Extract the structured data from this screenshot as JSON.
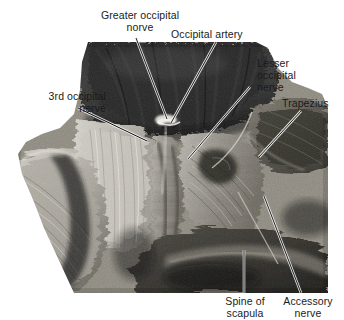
{
  "figure": {
    "kind": "anatomical-dissection-photograph",
    "region": "posterior neck and suboccipital region",
    "photo": {
      "left": 16,
      "top": 42,
      "width": 312,
      "height": 251,
      "tone": "black-and-white"
    }
  },
  "labels": [
    {
      "id": "greater-occipital-nerve",
      "name": "greater-occipital-nerve-label",
      "text": "Greater occipital\nnorve",
      "lines": [
        "Greater occipital",
        "norve"
      ],
      "leader": {
        "x1": 136,
        "y1": 38,
        "x2": 167,
        "y2": 119
      }
    },
    {
      "id": "occipital-artery",
      "name": "occipital-artery-label",
      "text": "Occipital artery",
      "lines": [
        "Occipital artery"
      ],
      "leader": {
        "x1": 216,
        "y1": 42,
        "x2": 171,
        "y2": 123
      }
    },
    {
      "id": "lesser-occipital-nerve",
      "name": "lesser-occipital-nerve-label",
      "text": "Lesser\noccipital\nnerve",
      "lines": [
        "Lesser",
        "occipital",
        "nerve"
      ],
      "leader": {
        "x1": 250,
        "y1": 87,
        "x2": 188,
        "y2": 159
      }
    },
    {
      "id": "trapezius",
      "name": "trapezius-label",
      "text": "Trapezius",
      "lines": [
        "Trapezius"
      ],
      "leader": {
        "x1": 301,
        "y1": 111,
        "x2": 259,
        "y2": 157
      }
    },
    {
      "id": "third-occipital-nerve",
      "name": "third-occipital-nerve-label",
      "text": "3rd occipital\nnerve",
      "lines": [
        "3rd occipital",
        "nerve"
      ],
      "leader": {
        "x1": 78,
        "y1": 108,
        "x2": 147,
        "y2": 141
      }
    },
    {
      "id": "spine-of-scapula",
      "name": "spine-of-scapula-label",
      "text": "Spine of\nscapula",
      "lines": [
        "Spine of",
        "scapula"
      ],
      "leader": {
        "x1": 244,
        "y1": 293,
        "x2": 244,
        "y2": 250
      }
    },
    {
      "id": "accessory-nerve",
      "name": "accessory-nerve-label",
      "text": "Accessory\nnerve",
      "lines": [
        "Accessory",
        "nerve"
      ],
      "leader": {
        "x1": 301,
        "y1": 293,
        "x2": 264,
        "y2": 196
      }
    }
  ],
  "colors": {
    "background": "#ffffff",
    "text": "#1a1a1a",
    "leader_dark": "#111111",
    "leader_light": "#f2f2f2"
  }
}
